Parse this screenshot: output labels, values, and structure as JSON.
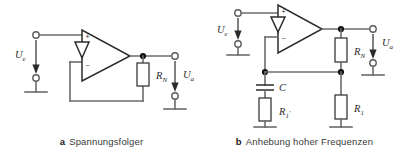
{
  "figure": {
    "background": "#ffffff",
    "wire_color": "#6b6b6b",
    "part_color": "#3a3a3a",
    "text_color": "#2b2b2b"
  },
  "panels": [
    {
      "id": "a",
      "caption_letter": "a",
      "caption_text": "Spannungsfolger",
      "opamp": {
        "name": "operational-amplifier",
        "plus_label": "+",
        "minus_label": "−"
      },
      "labels": {
        "input_source": "U",
        "input_source_sub": "e",
        "output": "U",
        "output_sub": "a",
        "feedback_resistor": "R",
        "feedback_resistor_sub": "N"
      },
      "components": [
        {
          "type": "resistor",
          "label": "R",
          "sub": "N"
        }
      ]
    },
    {
      "id": "b",
      "caption_letter": "b",
      "caption_text": "Anhebung hoher Frequenzen",
      "opamp": {
        "name": "operational-amplifier",
        "plus_label": "+",
        "minus_label": "−"
      },
      "labels": {
        "input_source": "U",
        "input_source_sub": "e",
        "output": "U",
        "output_sub": "a",
        "feedback_resistor": "R",
        "feedback_resistor_sub": "N",
        "capacitor": "C",
        "series_resistor": "R",
        "series_resistor_sub": "1",
        "series_resistor_prime": "′",
        "divider_resistor": "R",
        "divider_resistor_sub": "1"
      },
      "components": [
        {
          "type": "resistor",
          "label": "R",
          "sub": "N"
        },
        {
          "type": "capacitor",
          "label": "C",
          "sub": ""
        },
        {
          "type": "resistor",
          "label": "R",
          "sub": "1",
          "prime": "′"
        },
        {
          "type": "resistor",
          "label": "R",
          "sub": "1"
        }
      ]
    }
  ]
}
